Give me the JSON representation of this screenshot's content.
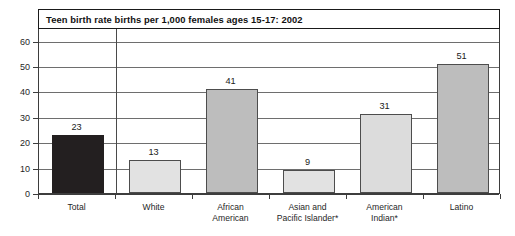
{
  "chart_data": {
    "type": "bar",
    "title": "Teen birth rate births per 1,000 females ages 15-17: 2002",
    "xlabel": "",
    "ylabel": "",
    "ylim": [
      0,
      65
    ],
    "yticks": [
      0,
      10,
      20,
      30,
      40,
      50,
      60
    ],
    "ytick_labels": [
      "0",
      "10",
      "20",
      "30",
      "40",
      "50",
      "60"
    ],
    "grid": true,
    "legend": null,
    "categories": [
      "Total",
      "White",
      "African\nAmerican",
      "Asian and\nPacific Islander*",
      "American\nIndian*",
      "Latino"
    ],
    "values": [
      23,
      13,
      41,
      9,
      31,
      51
    ],
    "value_labels": [
      "23",
      "13",
      "41",
      "9",
      "31",
      "51"
    ],
    "bar_colors": [
      "#231f20",
      "#e2e2e2",
      "#bdbdbd",
      "#e2e2e2",
      "#dcdcdc",
      "#bdbdbd"
    ]
  },
  "axis": {
    "tick_labels": [
      "60",
      "50",
      "40",
      "30",
      "20",
      "10",
      "0"
    ]
  },
  "categories": {
    "c0": "Total",
    "c1": "White",
    "c2": "African\nAmerican",
    "c3": "Asian and\nPacific Islander*",
    "c4": "American\nIndian*",
    "c5": "Latino"
  },
  "values": {
    "v0": "23",
    "v1": "13",
    "v2": "41",
    "v3": "9",
    "v4": "31",
    "v5": "51"
  }
}
